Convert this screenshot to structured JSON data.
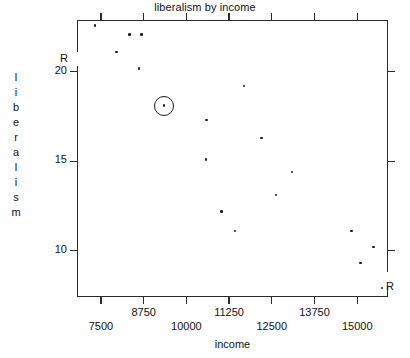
{
  "chart_data": {
    "type": "scatter",
    "title": "liberalism by income",
    "xlabel": "income",
    "ylabel": "liberalism",
    "ylabel_letters": [
      "l",
      "i",
      "b",
      "e",
      "r",
      "a",
      "l",
      "i",
      "s",
      "m"
    ],
    "xlim": [
      6800,
      15900
    ],
    "ylim": [
      7.4,
      22.9
    ],
    "grid": false,
    "legend": null,
    "xticks": [
      7500,
      8750,
      10000,
      11250,
      12500,
      13750,
      15000
    ],
    "xticklabels": [
      "7500",
      "8750",
      "10000",
      "11250",
      "12500",
      "13750",
      "15000"
    ],
    "yticks": [
      10,
      15,
      20
    ],
    "yticklabels": [
      "10",
      "15",
      "20"
    ],
    "points": [
      {
        "x": 7330,
        "y": 22.6
      },
      {
        "x": 7960,
        "y": 21.1
      },
      {
        "x": 8330,
        "y": 22.1
      },
      {
        "x": 8690,
        "y": 22.1
      },
      {
        "x": 8620,
        "y": 20.2
      },
      {
        "x": 9340,
        "y": 18.1
      },
      {
        "x": 10590,
        "y": 17.3
      },
      {
        "x": 10580,
        "y": 15.1
      },
      {
        "x": 11690,
        "y": 19.2
      },
      {
        "x": 12190,
        "y": 16.3
      },
      {
        "x": 11020,
        "y": 12.2
      },
      {
        "x": 11420,
        "y": 11.1
      },
      {
        "x": 13090,
        "y": 14.4
      },
      {
        "x": 12620,
        "y": 13.1
      },
      {
        "x": 14830,
        "y": 11.1
      },
      {
        "x": 15480,
        "y": 10.2
      },
      {
        "x": 15100,
        "y": 9.3
      },
      {
        "x": 15720,
        "y": 7.9
      }
    ],
    "highlighted_point": {
      "x": 9340,
      "y": 18.1
    },
    "annotations": [
      {
        "text": "R",
        "position": "y-axis-upper-left",
        "note": "axis range marker on left spine"
      },
      {
        "text": "R",
        "position": "bottom-right-point",
        "note": "label beside lowest-right point"
      }
    ]
  }
}
